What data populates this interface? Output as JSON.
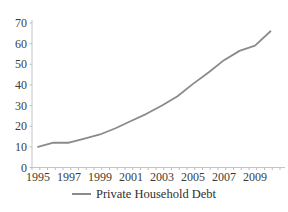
{
  "chart_data": {
    "type": "line",
    "x": [
      1995,
      1996,
      1997,
      1998,
      1999,
      2000,
      2001,
      2002,
      2003,
      2004,
      2005,
      2006,
      2007,
      2008,
      2009,
      2010
    ],
    "series": [
      {
        "name": "Private Household Debt",
        "values": [
          10,
          12,
          12,
          14,
          16,
          19,
          22.5,
          26,
          30,
          34.5,
          40.5,
          46,
          52,
          56.5,
          59,
          66
        ]
      }
    ],
    "xticklabels": [
      "1995",
      "1997",
      "1999",
      "2001",
      "2003",
      "2005",
      "2007",
      "2009"
    ],
    "yticks": [
      0,
      10,
      20,
      30,
      40,
      50,
      60,
      70
    ],
    "ylim": [
      0,
      70
    ],
    "grid": false,
    "legend_position": "bottom",
    "colors": {
      "line": "#8a8a8a",
      "axis": "#c4c4c4",
      "tick": "#bdbdbd",
      "text": "#3b3b3b"
    }
  }
}
